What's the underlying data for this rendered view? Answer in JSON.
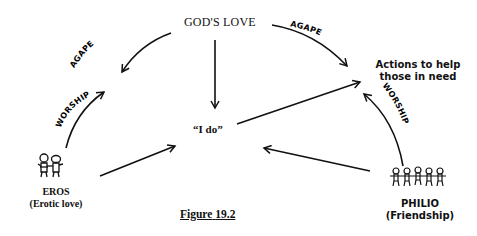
{
  "diagram": {
    "nodes": {
      "gods_love": "GOD'S LOVE",
      "i_do": "“I do”",
      "actions": {
        "line1": "Actions to help",
        "line2": "those in need"
      },
      "eros": {
        "name": "EROS",
        "subtitle": "(Erotic love)"
      },
      "philio": {
        "name": "PHILIO",
        "subtitle": "(Friendship)"
      }
    },
    "edges": {
      "agape_left": "AGAPE",
      "agape_right": "AGAPE",
      "worship_left": "WORSHIP",
      "worship_right": "WORSHIP"
    },
    "caption": {
      "label": "Figure",
      "number": "19.2"
    }
  }
}
